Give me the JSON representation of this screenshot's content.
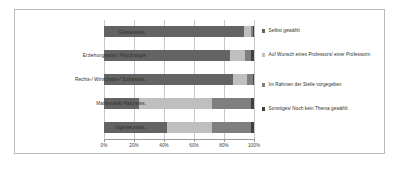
{
  "chart_data": {
    "type": "bar",
    "orientation": "horizontal",
    "stacked": true,
    "normalized": true,
    "title": "",
    "xlabel": "",
    "ylabel": "",
    "xlim": [
      0,
      100
    ],
    "grid": true,
    "legend_position": "right",
    "categories": [
      "Geisteswiss.",
      "Erziehungswiss./ Psychologie",
      "Rechts-/ Wirtschafts-/ Sozialwiss.",
      "Mathematik/ Naturwiss.",
      "Ingenieurwiss."
    ],
    "xticks": [
      0,
      20,
      40,
      60,
      80,
      100
    ],
    "xticklabels": [
      "0%",
      "20%",
      "40%",
      "60%",
      "80%",
      "100%"
    ],
    "series": [
      {
        "name": "Selbst gewählt",
        "color": "#636363",
        "values": [
          93,
          84,
          86,
          23,
          42
        ]
      },
      {
        "name": "Auf Wunsch eines Professors/ einer Professorin",
        "color": "#bfbfbf",
        "values": [
          5,
          10,
          9,
          49,
          30
        ]
      },
      {
        "name": "Im Rahmen der Stelle vorgegeben",
        "color": "#7f7f7f",
        "values": [
          1,
          4,
          4,
          26,
          26
        ]
      },
      {
        "name": "Sonstiges/ Noch kein Thema gewählt",
        "color": "#404040",
        "values": [
          1,
          2,
          1,
          2,
          2
        ]
      }
    ]
  },
  "legend": {
    "items": [
      {
        "label": "Selbst gewählt",
        "color": "#636363"
      },
      {
        "label": "Auf Wunsch eines Professors/ einer Professorin",
        "color": "#bfbfbf"
      },
      {
        "label": "Im Rahmen der Stelle vorgegeben",
        "color": "#7f7f7f"
      },
      {
        "label": "Sonstiges/ Noch kein Thema gewählt",
        "color": "#404040"
      }
    ]
  }
}
